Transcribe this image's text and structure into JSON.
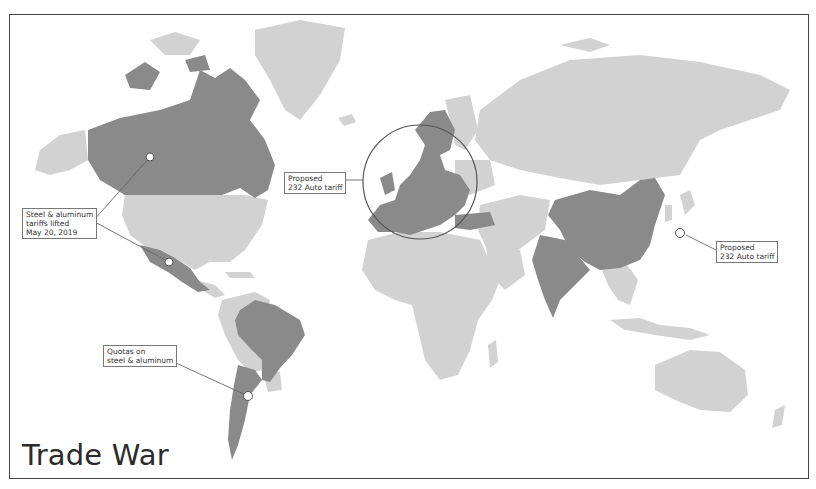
{
  "title": "Trade War",
  "colors": {
    "affected_country": "#8a8a8a",
    "other_land": "#d2d2d2",
    "background": "#ffffff",
    "frame": "#444444",
    "leader_line": "#666666"
  },
  "annotations": [
    {
      "id": "canada-mexico",
      "text": "Steel & aluminum\ntariffs lifted\nMay 20, 2019",
      "targets": [
        "Canada",
        "Mexico"
      ]
    },
    {
      "id": "eu",
      "text": "Proposed\n232 Auto tariff",
      "targets": [
        "European Union"
      ]
    },
    {
      "id": "japan",
      "text": "Proposed\n232 Auto tariff",
      "targets": [
        "Japan"
      ]
    },
    {
      "id": "argentina-brazil",
      "text": "Quotas on\nsteel & aluminum",
      "targets": [
        "Argentina",
        "Brazil"
      ]
    }
  ],
  "highlighted_regions": [
    "Canada",
    "Mexico",
    "Brazil",
    "Argentina",
    "European Union",
    "Turkey",
    "China",
    "India"
  ]
}
